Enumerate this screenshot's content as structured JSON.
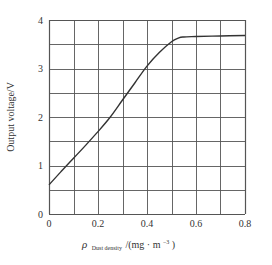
{
  "chart_data": {
    "type": "line",
    "title": "",
    "xlabel": "ρ Dust density /(mg · m⁻³)",
    "xlabel_parts": {
      "symbol": "ρ",
      "subscript": "Dust density",
      "unit": "/(mg · m",
      "exp": "−3",
      "close": ")"
    },
    "ylabel": "Output voltage/V",
    "xlim": [
      0,
      0.8
    ],
    "ylim": [
      0,
      4
    ],
    "grid": true,
    "x_grid_step": 0.1,
    "y_grid_step": 0.5,
    "x_ticks": [
      0,
      0.2,
      0.4,
      0.6,
      0.8
    ],
    "x_tick_labels": [
      "0",
      "0.2",
      "0.4",
      "0.6",
      "0.8"
    ],
    "y_ticks": [
      0,
      1,
      2,
      3,
      4
    ],
    "y_tick_labels": [
      "0",
      "1",
      "2",
      "3",
      "4"
    ],
    "legend": null,
    "series": [
      {
        "name": "Output voltage",
        "x": [
          0,
          0.05,
          0.1,
          0.15,
          0.2,
          0.25,
          0.3,
          0.35,
          0.4,
          0.45,
          0.5,
          0.53,
          0.55,
          0.6,
          0.7,
          0.8
        ],
        "y": [
          0.6,
          0.88,
          1.15,
          1.42,
          1.7,
          2.0,
          2.35,
          2.7,
          3.05,
          3.33,
          3.55,
          3.63,
          3.65,
          3.66,
          3.67,
          3.68
        ]
      }
    ]
  },
  "colors": {
    "grid": "#555555",
    "line": "#333333",
    "text": "#333333"
  }
}
